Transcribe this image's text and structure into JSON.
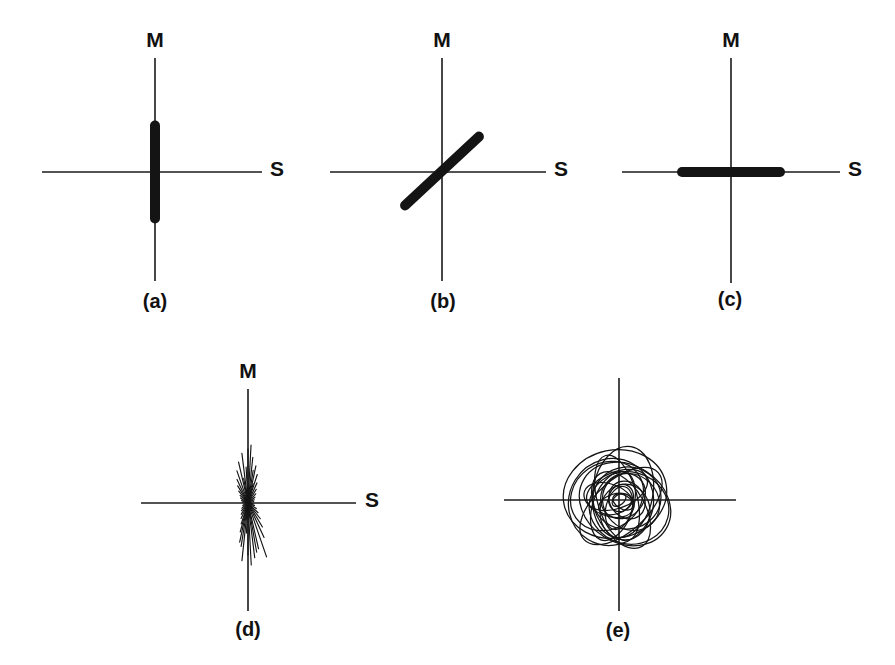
{
  "figure": {
    "width": 895,
    "height": 665,
    "background": "#ffffff",
    "ink_color": "#141414",
    "axis_label_vertical": "M",
    "axis_label_horizontal": "S"
  },
  "panels": [
    {
      "id": "a",
      "label": "(a)",
      "label_x": 155,
      "label_y": 303,
      "origin_x": 155,
      "origin_y": 172,
      "axis_h_x1": 42,
      "axis_h_x2": 262,
      "axis_v_y1": 58,
      "axis_v_y2": 281,
      "m_label_x": 155,
      "m_label_y": 41,
      "s_label_x": 277,
      "s_label_y": 170,
      "has_m_label": true,
      "has_s_label": true,
      "state": "linear-vertical",
      "description": "Linear polarization aligned with the M axis",
      "bar": {
        "angle_deg": 90,
        "length": 93,
        "width": 10,
        "offset_x": 0,
        "offset_y": 0
      }
    },
    {
      "id": "b",
      "label": "(b)",
      "label_x": 443,
      "label_y": 303,
      "origin_x": 442,
      "origin_y": 172,
      "axis_h_x1": 330,
      "axis_h_x2": 546,
      "axis_v_y1": 58,
      "axis_v_y2": 281,
      "m_label_x": 442,
      "m_label_y": 41,
      "s_label_x": 561,
      "s_label_y": 170,
      "has_m_label": true,
      "has_s_label": true,
      "state": "linear-diagonal",
      "description": "Linear polarization at 45 degrees between M and S",
      "bar": {
        "angle_deg": 43,
        "length": 101,
        "width": 10,
        "offset_x": 0,
        "offset_y": -1
      }
    },
    {
      "id": "c",
      "label": "(c)",
      "label_x": 730,
      "label_y": 301,
      "origin_x": 731,
      "origin_y": 172,
      "axis_h_x1": 622,
      "axis_h_x2": 840,
      "axis_v_y1": 58,
      "axis_v_y2": 283,
      "m_label_x": 731,
      "m_label_y": 41,
      "s_label_x": 855,
      "s_label_y": 170,
      "has_m_label": true,
      "has_s_label": true,
      "state": "linear-horizontal",
      "description": "Linear polarization aligned with the S axis",
      "bar": {
        "angle_deg": 0,
        "length": 98,
        "width": 10,
        "offset_x": 0,
        "offset_y": 0
      }
    },
    {
      "id": "d",
      "label": "(d)",
      "label_x": 248,
      "label_y": 631,
      "origin_x": 248,
      "origin_y": 503,
      "axis_h_x1": 141,
      "axis_h_x2": 356,
      "axis_v_y1": 389,
      "axis_v_y2": 611,
      "m_label_x": 248,
      "m_label_y": 372,
      "s_label_x": 372,
      "s_label_y": 501,
      "has_m_label": true,
      "has_s_label": true,
      "state": "partially-polarized-starburst",
      "description": "Bundle of narrow linear states clustered about the M axis",
      "rays": [
        {
          "angle_deg": 90,
          "len_pos": 54,
          "len_neg": 52
        },
        {
          "angle_deg": 84,
          "len_pos": 46,
          "len_neg": 58
        },
        {
          "angle_deg": 78,
          "len_pos": 38,
          "len_neg": 40
        },
        {
          "angle_deg": 72,
          "len_pos": 30,
          "len_neg": 22
        },
        {
          "angle_deg": 66,
          "len_pos": 22,
          "len_neg": 17
        },
        {
          "angle_deg": 59,
          "len_pos": 16,
          "len_neg": 13
        },
        {
          "angle_deg": 50,
          "len_pos": 12,
          "len_neg": 10
        },
        {
          "angle_deg": 40,
          "len_pos": 9,
          "len_neg": 8
        },
        {
          "angle_deg": 28,
          "len_pos": 7,
          "len_neg": 6
        },
        {
          "angle_deg": 14,
          "len_pos": 6,
          "len_neg": 5
        },
        {
          "angle_deg": 97,
          "len_pos": 50,
          "len_neg": 55
        },
        {
          "angle_deg": 103,
          "len_pos": 42,
          "len_neg": 47
        },
        {
          "angle_deg": 109,
          "len_pos": 34,
          "len_neg": 57
        },
        {
          "angle_deg": 115,
          "len_pos": 26,
          "len_neg": 38
        },
        {
          "angle_deg": 121,
          "len_pos": 20,
          "len_neg": 28
        },
        {
          "angle_deg": 128,
          "len_pos": 15,
          "len_neg": 20
        },
        {
          "angle_deg": 136,
          "len_pos": 11,
          "len_neg": 14
        },
        {
          "angle_deg": 146,
          "len_pos": 9,
          "len_neg": 10
        },
        {
          "angle_deg": 158,
          "len_pos": 7,
          "len_neg": 7
        },
        {
          "angle_deg": 170,
          "len_pos": 6,
          "len_neg": 6
        },
        {
          "angle_deg": 87,
          "len_pos": 58,
          "len_neg": 30
        },
        {
          "angle_deg": 93,
          "len_pos": 36,
          "len_neg": 62
        },
        {
          "angle_deg": 100,
          "len_pos": 25,
          "len_neg": 50
        },
        {
          "angle_deg": 81,
          "len_pos": 33,
          "len_neg": 44
        },
        {
          "angle_deg": 75,
          "len_pos": 20,
          "len_neg": 30
        }
      ]
    },
    {
      "id": "e",
      "label": "(e)",
      "label_x": 618,
      "label_y": 632,
      "origin_x": 619,
      "origin_y": 500,
      "axis_h_x1": 504,
      "axis_h_x2": 736,
      "axis_v_y1": 378,
      "axis_v_y2": 611,
      "m_label_x": 619,
      "m_label_y": 362,
      "s_label_x": 752,
      "s_label_y": 498,
      "has_m_label": false,
      "has_s_label": false,
      "state": "unpolarized-ellipse-cluster",
      "description": "Superposition of many elliptical states of random size and orientation",
      "ellipses": [
        {
          "rx": 52,
          "ry": 44,
          "rot_deg": 12,
          "cx": -4,
          "cy": -6
        },
        {
          "rx": 48,
          "ry": 39,
          "rot_deg": -32,
          "cx": 6,
          "cy": 4
        },
        {
          "rx": 44,
          "ry": 42,
          "rot_deg": 58,
          "cx": -8,
          "cy": 2
        },
        {
          "rx": 46,
          "ry": 30,
          "rot_deg": 80,
          "cx": 4,
          "cy": -8
        },
        {
          "rx": 40,
          "ry": 36,
          "rot_deg": -14,
          "cx": 10,
          "cy": 8
        },
        {
          "rx": 38,
          "ry": 33,
          "rot_deg": 35,
          "cx": -12,
          "cy": -4
        },
        {
          "rx": 42,
          "ry": 24,
          "rot_deg": -60,
          "cx": 2,
          "cy": 10
        },
        {
          "rx": 34,
          "ry": 31,
          "rot_deg": 5,
          "cx": 8,
          "cy": -2
        },
        {
          "rx": 36,
          "ry": 20,
          "rot_deg": 70,
          "cx": -6,
          "cy": 6
        },
        {
          "rx": 30,
          "ry": 27,
          "rot_deg": -45,
          "cx": 12,
          "cy": 2
        },
        {
          "rx": 32,
          "ry": 18,
          "rot_deg": 22,
          "cx": -2,
          "cy": -10
        },
        {
          "rx": 28,
          "ry": 25,
          "rot_deg": 88,
          "cx": 6,
          "cy": 12
        },
        {
          "rx": 26,
          "ry": 16,
          "rot_deg": -20,
          "cx": -10,
          "cy": 0
        },
        {
          "rx": 24,
          "ry": 21,
          "rot_deg": 48,
          "cx": 4,
          "cy": -4
        },
        {
          "rx": 22,
          "ry": 13,
          "rot_deg": 75,
          "cx": 0,
          "cy": 8
        },
        {
          "rx": 20,
          "ry": 17,
          "rot_deg": -52,
          "cx": 8,
          "cy": 0
        },
        {
          "rx": 17,
          "ry": 10,
          "rot_deg": 18,
          "cx": -4,
          "cy": 4
        },
        {
          "rx": 14,
          "ry": 12,
          "rot_deg": 62,
          "cx": 2,
          "cy": -2
        },
        {
          "rx": 11,
          "ry": 7,
          "rot_deg": -30,
          "cx": 4,
          "cy": 2
        },
        {
          "rx": 8,
          "ry": 5,
          "rot_deg": 40,
          "cx": 0,
          "cy": 0
        },
        {
          "rx": 44,
          "ry": 20,
          "rot_deg": -75,
          "cx": -2,
          "cy": -2
        },
        {
          "rx": 50,
          "ry": 26,
          "rot_deg": 42,
          "cx": 2,
          "cy": 6
        }
      ]
    }
  ]
}
